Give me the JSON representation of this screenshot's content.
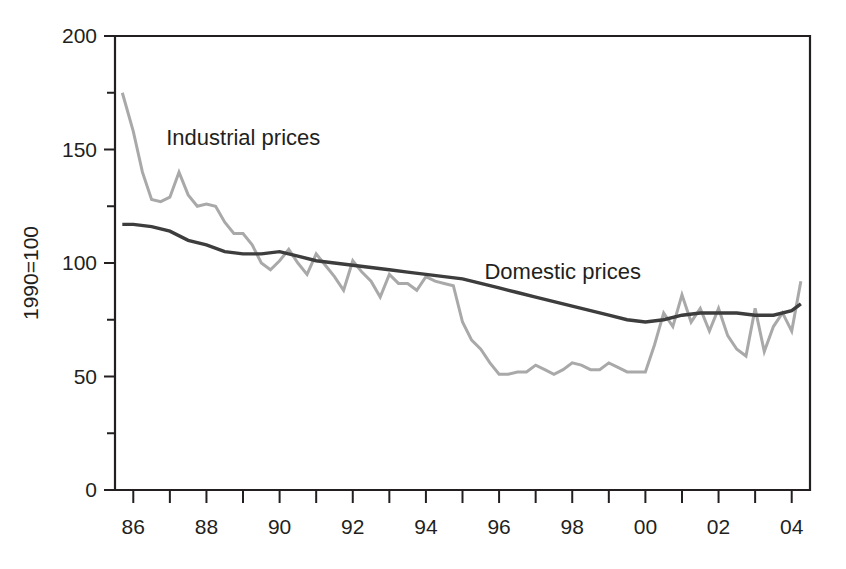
{
  "chart_data": {
    "type": "line",
    "title": "",
    "xlabel": "",
    "ylabel": "1990=100",
    "ylim": [
      0,
      200
    ],
    "xlim": [
      1985.5,
      2004.5
    ],
    "grid": false,
    "legend_position": "inline-annotations",
    "y_ticks_major": [
      0,
      50,
      100,
      150,
      200
    ],
    "y_ticks_major_labels": [
      "0",
      "50",
      "100",
      "150",
      "200"
    ],
    "y_ticks_minor": [
      25,
      75,
      125,
      175
    ],
    "x_ticks_major": [
      1986,
      1988,
      1990,
      1992,
      1994,
      1996,
      1998,
      2000,
      2002,
      2004
    ],
    "x_ticks_major_labels": [
      "86",
      "88",
      "90",
      "92",
      "94",
      "96",
      "98",
      "00",
      "02",
      "04"
    ],
    "x_ticks_minor": [
      1987,
      1989,
      1991,
      1993,
      1995,
      1997,
      1999,
      2001,
      2003
    ],
    "annotations": [
      {
        "text": "Industrial prices",
        "x": 1986.9,
        "y": 152
      },
      {
        "text": "Domestic prices",
        "x": 1995.6,
        "y": 93
      }
    ],
    "series": [
      {
        "name": "Industrial prices",
        "color": "#a9a9a9",
        "width": 3.0,
        "x": [
          1985.7,
          1986.0,
          1986.25,
          1986.5,
          1986.75,
          1987.0,
          1987.25,
          1987.5,
          1987.75,
          1988.0,
          1988.25,
          1988.5,
          1988.75,
          1989.0,
          1989.25,
          1989.5,
          1989.75,
          1990.0,
          1990.25,
          1990.5,
          1990.75,
          1991.0,
          1991.25,
          1991.5,
          1991.75,
          1992.0,
          1992.25,
          1992.5,
          1992.75,
          1993.0,
          1993.25,
          1993.5,
          1993.75,
          1994.0,
          1994.25,
          1994.5,
          1994.75,
          1995.0,
          1995.25,
          1995.5,
          1995.75,
          1996.0,
          1996.25,
          1996.5,
          1996.75,
          1997.0,
          1997.25,
          1997.5,
          1997.75,
          1998.0,
          1998.25,
          1998.5,
          1998.75,
          1999.0,
          1999.25,
          1999.5,
          1999.75,
          2000.0,
          2000.25,
          2000.5,
          2000.75,
          2001.0,
          2001.25,
          2001.5,
          2001.75,
          2002.0,
          2002.25,
          2002.5,
          2002.75,
          2003.0,
          2003.25,
          2003.5,
          2003.75,
          2004.0,
          2004.25
        ],
        "values": [
          175,
          158,
          140,
          128,
          127,
          129,
          140,
          130,
          125,
          126,
          125,
          118,
          113,
          113,
          108,
          100,
          97,
          101,
          106,
          100,
          95,
          104,
          99,
          94,
          88,
          101,
          96,
          92,
          85,
          95,
          91,
          91,
          88,
          94,
          92,
          91,
          90,
          74,
          66,
          62,
          56,
          51,
          51,
          52,
          52,
          55,
          53,
          51,
          53,
          56,
          55,
          53,
          53,
          56,
          54,
          52,
          52,
          52,
          64,
          78,
          72,
          86,
          74,
          80,
          70,
          80,
          68,
          62,
          59,
          80,
          61,
          72,
          78,
          70,
          92
        ]
      },
      {
        "name": "Domestic prices",
        "color": "#3d3d3d",
        "width": 3.4,
        "x": [
          1985.7,
          1986.0,
          1986.5,
          1987.0,
          1987.5,
          1988.0,
          1988.5,
          1989.0,
          1989.5,
          1990.0,
          1990.5,
          1991.0,
          1991.5,
          1992.0,
          1992.5,
          1993.0,
          1993.5,
          1994.0,
          1994.5,
          1995.0,
          1995.5,
          1996.0,
          1996.5,
          1997.0,
          1997.5,
          1998.0,
          1998.5,
          1999.0,
          1999.5,
          2000.0,
          2000.5,
          2001.0,
          2001.5,
          2002.0,
          2002.5,
          2003.0,
          2003.5,
          2004.0,
          2004.25
        ],
        "values": [
          117,
          117,
          116,
          114,
          110,
          108,
          105,
          104,
          104,
          105,
          103,
          101,
          100,
          99,
          98,
          97,
          96,
          95,
          94,
          93,
          91,
          89,
          87,
          85,
          83,
          81,
          79,
          77,
          75,
          74,
          75,
          77,
          78,
          78,
          78,
          77,
          77,
          79,
          82
        ]
      }
    ]
  }
}
